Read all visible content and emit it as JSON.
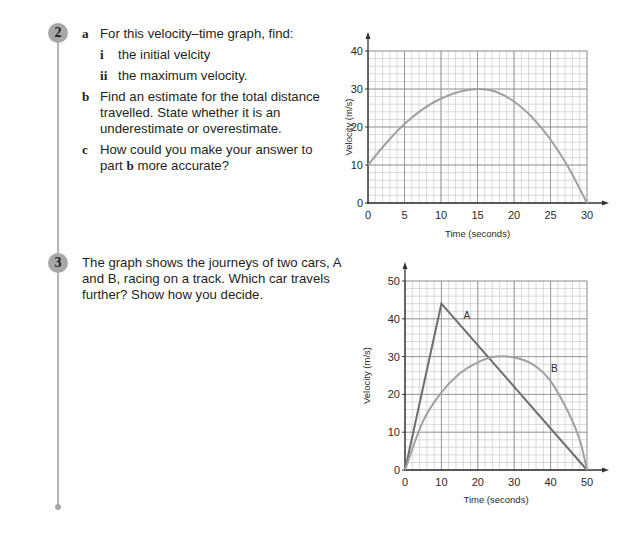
{
  "questions": [
    {
      "number": "2",
      "parts": [
        {
          "label": "a",
          "text": "For this velocity–time graph, find:"
        },
        {
          "label": "i",
          "text": "the initial velcity"
        },
        {
          "label": "ii",
          "text": "the maximum velocity."
        },
        {
          "label": "b",
          "text": "Find an estimate for the total distance travelled. State whether it is an underestimate or overestimate."
        },
        {
          "label": "c",
          "text_before": "How could you make your answer to part ",
          "bold": "b",
          "text_after": " more accurate?"
        }
      ]
    },
    {
      "number": "3",
      "text": "The graph shows the journeys of two cars, A and B, racing on a track. Which car travels further? Show how you decide."
    }
  ],
  "colors": {
    "curve": "#a0a0a0",
    "line_a": "#6e6e6e",
    "grid_minor": "#c8c8c8",
    "grid_major": "#8a8a8a",
    "badge": "#a7a7a7"
  },
  "chart_data": [
    {
      "type": "line",
      "title": "",
      "xlabel": "Time (seconds)",
      "ylabel": "Velocity (m/s)",
      "xlim": [
        0,
        30
      ],
      "ylim": [
        0,
        40
      ],
      "xticks": [
        0,
        5,
        10,
        15,
        20,
        25,
        30
      ],
      "yticks": [
        0,
        10,
        20,
        30,
        40
      ],
      "grid": true,
      "series": [
        {
          "name": "velocity",
          "x": [
            0,
            2.5,
            5,
            7.5,
            10,
            12.5,
            15,
            17.5,
            20,
            22.5,
            25,
            27.5,
            30
          ],
          "y": [
            10,
            15.8,
            20.8,
            24.7,
            27.5,
            29.3,
            30,
            29.3,
            26.7,
            22.5,
            16.7,
            9.2,
            0
          ]
        }
      ]
    },
    {
      "type": "line",
      "title": "",
      "xlabel": "Time (seconds)",
      "ylabel": "Velocity (m/s)",
      "xlim": [
        0,
        50
      ],
      "ylim": [
        0,
        50
      ],
      "xticks": [
        0,
        10,
        20,
        30,
        40,
        50
      ],
      "yticks": [
        0,
        10,
        20,
        30,
        40,
        50
      ],
      "grid": true,
      "series": [
        {
          "name": "A",
          "x": [
            0,
            10,
            50
          ],
          "y": [
            0,
            44,
            0
          ]
        },
        {
          "name": "B",
          "x": [
            0,
            5,
            10,
            15,
            20,
            25,
            30,
            35,
            40,
            45,
            48,
            50
          ],
          "y": [
            0,
            13,
            20.5,
            25.5,
            28.5,
            30,
            29.8,
            28,
            23.5,
            15,
            8,
            0
          ]
        }
      ],
      "annotations": [
        {
          "text": "A",
          "x": 17,
          "y": 40
        },
        {
          "text": "B",
          "x": 41,
          "y": 26
        }
      ]
    }
  ]
}
